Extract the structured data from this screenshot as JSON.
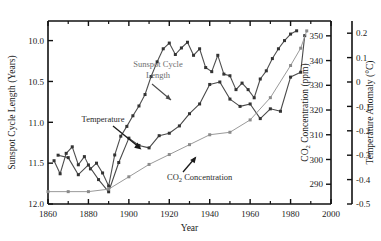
{
  "figure": {
    "background": "#ffffff",
    "plot_area": {
      "left": 48,
      "right": 331,
      "top": 21,
      "bottom": 204
    }
  },
  "chart_data": {
    "type": "line",
    "title": "",
    "xlabel": "Year",
    "ylabel": "Sunspot Cycle Length (Years)",
    "y2label": "CO₂ Concentration (ppm)",
    "y3label": "Temperature Anomaly (°C)",
    "xlim": [
      1860,
      2000
    ],
    "xticks": [
      1860,
      1880,
      1900,
      1920,
      1940,
      1960,
      1980,
      2000
    ],
    "xticklabels": [
      "1860",
      "1880",
      "1900",
      "1920",
      "1940",
      "1960",
      "1980",
      "2000"
    ],
    "xminorticks": [
      1870,
      1890,
      1910,
      1930,
      1950,
      1970,
      1990
    ],
    "ylim": [
      12.0,
      9.76
    ],
    "y_inverted": true,
    "yticks": [
      10.0,
      10.5,
      11.0,
      11.5,
      12.0
    ],
    "yticklabels": [
      "10.0",
      "10.5",
      "11.0",
      "11.5",
      "12.0"
    ],
    "y2lim": [
      282,
      356
    ],
    "y2ticks": [
      290,
      300,
      310,
      320,
      330,
      340,
      350
    ],
    "y2ticklabels": [
      "290",
      "300",
      "310",
      "320",
      "330",
      "340",
      "350"
    ],
    "y3lim": [
      -0.5,
      0.25
    ],
    "y3ticks": [
      -0.5,
      -0.4,
      -0.3,
      -0.2,
      -0.1,
      0,
      0.1,
      0.2
    ],
    "y3ticklabels": [
      "-0.5",
      "-0.4",
      "-0.3",
      "-0.2",
      "-0.1",
      "0",
      "0.1",
      "0.2"
    ],
    "grid": false,
    "legend": "annotations-inline",
    "series": [
      {
        "name": "Sunspot Cycle Length",
        "axis": "left",
        "color": "#4f4f4f",
        "marker": "square",
        "points": [
          [
            1863,
            11.47
          ],
          [
            1866,
            11.63
          ],
          [
            1869,
            11.38
          ],
          [
            1872,
            11.3
          ],
          [
            1875,
            11.52
          ],
          [
            1878,
            11.42
          ],
          [
            1881,
            11.57
          ],
          [
            1884,
            11.5
          ],
          [
            1887,
            11.62
          ],
          [
            1890,
            11.78
          ],
          [
            1893,
            11.4
          ],
          [
            1896,
            11.17
          ],
          [
            1899,
            11.05
          ],
          [
            1902,
            10.92
          ],
          [
            1905,
            10.8
          ],
          [
            1908,
            10.66
          ],
          [
            1911,
            10.44
          ],
          [
            1914,
            10.26
          ],
          [
            1917,
            10.1
          ],
          [
            1920,
            10.03
          ],
          [
            1923,
            10.17
          ],
          [
            1926,
            10.09
          ],
          [
            1929,
            10.02
          ],
          [
            1932,
            10.18
          ],
          [
            1935,
            10.1
          ],
          [
            1938,
            10.33
          ],
          [
            1941,
            10.38
          ],
          [
            1944,
            10.18
          ],
          [
            1947,
            10.41
          ],
          [
            1950,
            10.43
          ],
          [
            1953,
            10.6
          ],
          [
            1956,
            10.52
          ],
          [
            1959,
            10.6
          ],
          [
            1962,
            10.7
          ],
          [
            1965,
            10.47
          ],
          [
            1968,
            10.37
          ],
          [
            1971,
            10.22
          ],
          [
            1974,
            10.1
          ],
          [
            1977,
            10.0
          ],
          [
            1980,
            9.92
          ],
          [
            1983,
            9.88
          ]
        ]
      },
      {
        "name": "Temperature",
        "axis": "right-temperature",
        "color": "#4a4a4a",
        "marker": "square",
        "points": [
          [
            1865,
            -0.3
          ],
          [
            1870,
            -0.31
          ],
          [
            1875,
            -0.38
          ],
          [
            1880,
            -0.34
          ],
          [
            1885,
            -0.4
          ],
          [
            1890,
            -0.45
          ],
          [
            1895,
            -0.33
          ],
          [
            1900,
            -0.23
          ],
          [
            1905,
            -0.26
          ],
          [
            1910,
            -0.27
          ],
          [
            1915,
            -0.22
          ],
          [
            1920,
            -0.21
          ],
          [
            1925,
            -0.18
          ],
          [
            1930,
            -0.13
          ],
          [
            1935,
            -0.09
          ],
          [
            1940,
            -0.01
          ],
          [
            1945,
            0.0
          ],
          [
            1950,
            -0.07
          ],
          [
            1955,
            -0.1
          ],
          [
            1960,
            -0.09
          ],
          [
            1965,
            -0.15
          ],
          [
            1970,
            -0.11
          ],
          [
            1975,
            -0.12
          ],
          [
            1980,
            0.02
          ],
          [
            1985,
            0.04
          ],
          [
            1987,
            0.19
          ]
        ]
      },
      {
        "name": "CO2 Concentration",
        "axis": "right-co2",
        "color": "#9a9a9a",
        "marker": "square",
        "points": [
          [
            1860,
            287
          ],
          [
            1870,
            287
          ],
          [
            1880,
            287
          ],
          [
            1890,
            288
          ],
          [
            1900,
            293
          ],
          [
            1910,
            298
          ],
          [
            1920,
            302
          ],
          [
            1930,
            306
          ],
          [
            1940,
            310
          ],
          [
            1950,
            311
          ],
          [
            1960,
            316
          ],
          [
            1970,
            325
          ],
          [
            1980,
            338
          ],
          [
            1985,
            345
          ],
          [
            1988,
            352
          ]
        ]
      }
    ],
    "annotations": [
      {
        "id": "sunspot-label",
        "text_line1": "Sunspot Cycle",
        "text_line2": "Length",
        "color": "#6e6e6e"
      },
      {
        "id": "temperature-label",
        "text": "Temperature",
        "color": "#2a2a2a"
      },
      {
        "id": "co2-label",
        "text_prefix": "CO",
        "text_sub": "2",
        "text_suffix": " Concentration",
        "color": "#2a2a2a"
      }
    ]
  },
  "labels": {
    "ylabel_left": "Sunspot Cycle Length (Years)",
    "ylabel_co2_prefix": "CO",
    "ylabel_co2_sub": "2",
    "ylabel_co2_suffix": " Concentration (ppm)",
    "ylabel_temp": "Temperature Anomaly (°C)",
    "xlabel": "Year"
  }
}
